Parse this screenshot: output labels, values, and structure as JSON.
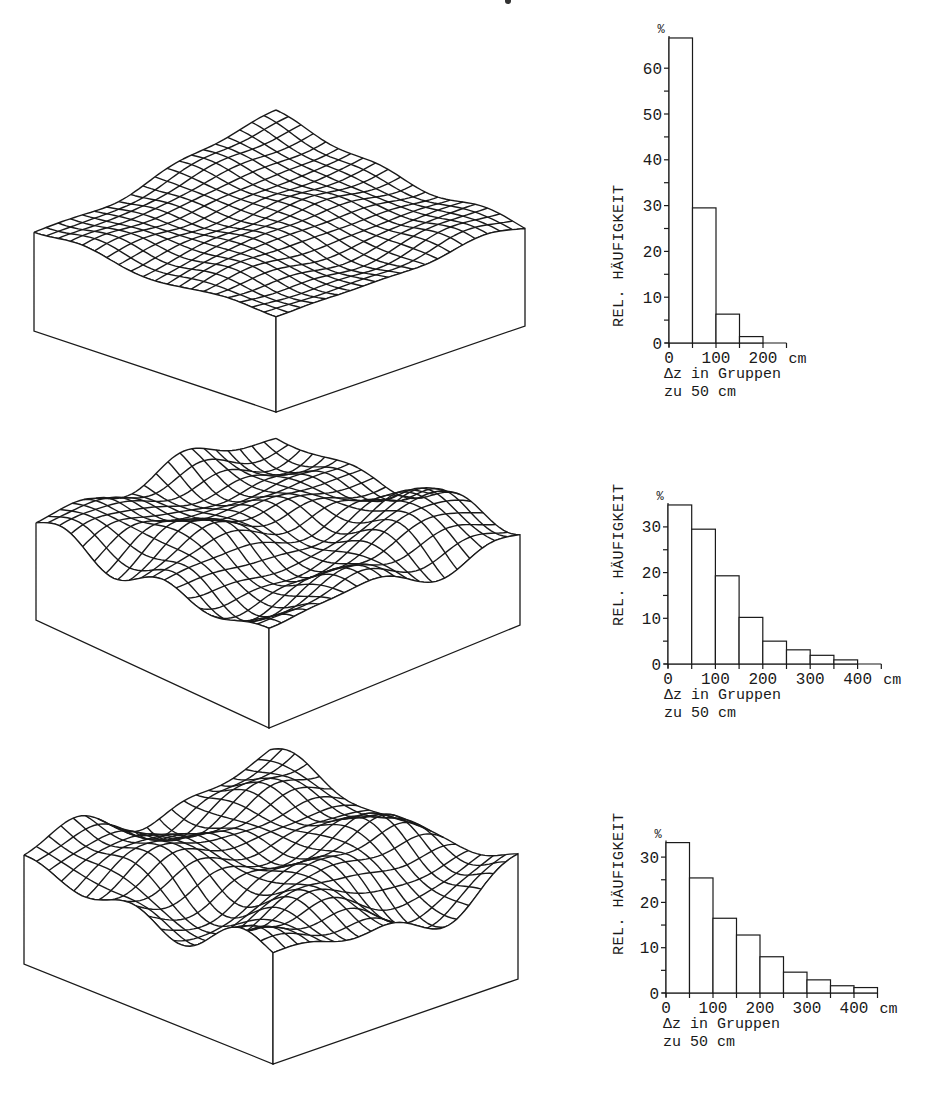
{
  "figure": {
    "panels": [
      {
        "id": "panel-1",
        "surface": {
          "name": "terrain-surface-low-relief",
          "left": [
            34,
            237
          ],
          "right": [
            525,
            232
          ],
          "front": [
            276,
            318
          ],
          "back": [
            276,
            120
          ],
          "base_depth": 94,
          "relief_px": 9,
          "grid": 20
        },
        "hist": {
          "left": 669,
          "baseline": 343,
          "px_per_unit": 4.58,
          "px_per_bin": 23.5,
          "bins_on_axis": 5,
          "tick_top": 60,
          "tick_step": 10,
          "minor_step": 5,
          "xticks": [
            "0",
            "100",
            "200"
          ],
          "xunit": "cm",
          "ylabel_pos": [
            623,
            327
          ]
        }
      },
      {
        "id": "panel-2",
        "surface": {
          "name": "terrain-surface-medium-relief",
          "left": [
            36,
            532
          ],
          "right": [
            520,
            537
          ],
          "front": [
            269,
            640
          ],
          "back": [
            276,
            440
          ],
          "base_depth": 88,
          "relief_px": 26,
          "grid": 20
        },
        "hist": {
          "left": 668,
          "baseline": 664,
          "px_per_unit": 4.57,
          "px_per_bin": 23.7,
          "bins_on_axis": 9,
          "tick_top": 30,
          "tick_step": 10,
          "minor_step": 5,
          "xticks": [
            "0",
            "100",
            "200",
            "300",
            "400"
          ],
          "xunit": "cm",
          "ylabel_pos": [
            623,
            626
          ]
        }
      },
      {
        "id": "panel-3",
        "surface": {
          "name": "terrain-surface-high-relief",
          "left": [
            24,
            870
          ],
          "right": [
            518,
            885
          ],
          "front": [
            273,
            970
          ],
          "back": [
            270,
            760
          ],
          "base_depth": 94,
          "relief_px": 30,
          "grid": 20
        },
        "hist": {
          "left": 666,
          "baseline": 993,
          "px_per_unit": 4.53,
          "px_per_bin": 23.5,
          "bins_on_axis": 9,
          "tick_top": 30,
          "tick_step": 10,
          "minor_step": 5,
          "xticks": [
            "0",
            "100",
            "200",
            "300",
            "400"
          ],
          "xunit": "cm",
          "ylabel_pos": [
            623,
            955
          ]
        }
      }
    ],
    "labels": {
      "ylabel": "REL. HÄUFIGKEIT",
      "percent_sign": "%",
      "xlabel_line1": "Δz in Gruppen",
      "xlabel_line2": "zu 50 cm"
    },
    "colors": {
      "ink": "#1a1a1a",
      "background": "#ffffff"
    }
  },
  "chart_data": [
    {
      "type": "bar",
      "title": "",
      "xlabel": "Δz in Gruppen zu 50 cm",
      "ylabel": "REL. HÄUFIGKEIT (%)",
      "categories": [
        "0-50",
        "50-100",
        "100-150",
        "150-200"
      ],
      "values": [
        66.6,
        29.5,
        6.3,
        1.4
      ],
      "xticks": [
        0,
        100,
        200
      ],
      "xunit": "cm",
      "ylim": [
        0,
        70
      ],
      "yticks": [
        0,
        10,
        20,
        30,
        40,
        50,
        60
      ],
      "grid": false,
      "legend": null
    },
    {
      "type": "bar",
      "title": "",
      "xlabel": "Δz in Gruppen zu 50 cm",
      "ylabel": "REL. HÄUFIGKEIT (%)",
      "categories": [
        "0-50",
        "50-100",
        "100-150",
        "150-200",
        "200-250",
        "250-300",
        "300-350",
        "350-400"
      ],
      "values": [
        34.8,
        29.5,
        19.3,
        10.2,
        5.0,
        3.1,
        1.9,
        0.9
      ],
      "xticks": [
        0,
        100,
        200,
        300,
        400
      ],
      "xunit": "cm",
      "ylim": [
        0,
        35
      ],
      "yticks": [
        0,
        10,
        20,
        30
      ],
      "grid": false,
      "legend": null
    },
    {
      "type": "bar",
      "title": "",
      "xlabel": "Δz in Gruppen zu 50 cm",
      "ylabel": "REL. HÄUFIGKEIT (%)",
      "categories": [
        "0-50",
        "50-100",
        "100-150",
        "150-200",
        "200-250",
        "250-300",
        "300-350",
        "350-400",
        "400-450"
      ],
      "values": [
        33.2,
        25.4,
        16.5,
        12.8,
        8.0,
        4.6,
        2.9,
        1.6,
        1.2
      ],
      "xticks": [
        0,
        100,
        200,
        300,
        400
      ],
      "xunit": "cm",
      "ylim": [
        0,
        35
      ],
      "yticks": [
        0,
        10,
        20,
        30
      ],
      "grid": false,
      "legend": null
    }
  ]
}
